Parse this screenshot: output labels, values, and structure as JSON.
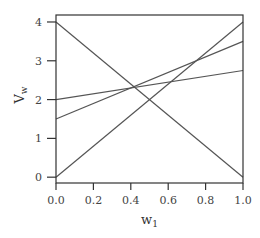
{
  "chart_data": {
    "type": "line",
    "title": "",
    "xlabel": "w",
    "xlabel_subscript": "1",
    "ylabel": "V",
    "ylabel_subscript": "w",
    "xlim": [
      0.0,
      1.0
    ],
    "ylim": [
      -0.15,
      4.18
    ],
    "xticks": [
      "0.0",
      "0.2",
      "0.4",
      "0.6",
      "0.8",
      "1.0"
    ],
    "yticks": [
      "0",
      "1",
      "2",
      "3",
      "4"
    ],
    "grid": false,
    "legend": null,
    "line_color": "#555555",
    "frame_color": "#333333",
    "series": [
      {
        "name": "line-a",
        "x": [
          0.0,
          1.0
        ],
        "y": [
          4.0,
          0.0
        ]
      },
      {
        "name": "line-b",
        "x": [
          0.0,
          1.0
        ],
        "y": [
          0.0,
          4.0
        ]
      },
      {
        "name": "line-c",
        "x": [
          0.0,
          1.0
        ],
        "y": [
          1.5,
          3.5
        ]
      },
      {
        "name": "line-d",
        "x": [
          0.0,
          1.0
        ],
        "y": [
          2.0,
          2.75
        ]
      }
    ]
  }
}
